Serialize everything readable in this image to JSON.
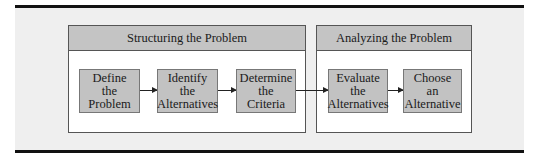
{
  "groups": [
    {
      "title": "Structuring the Problem"
    },
    {
      "title": "Analyzing the Problem"
    }
  ],
  "steps": [
    {
      "lines": [
        "Define",
        "the",
        "Problem"
      ]
    },
    {
      "lines": [
        "Identify",
        "the",
        "Alternatives"
      ]
    },
    {
      "lines": [
        "Determine",
        "the",
        "Criteria"
      ]
    },
    {
      "lines": [
        "Evaluate",
        "the",
        "Alternatives"
      ]
    },
    {
      "lines": [
        "Choose",
        "an",
        "Alternative"
      ]
    }
  ],
  "colors": {
    "panel_background": "#efefef",
    "header_fill": "#c4c4c4",
    "step_fill": "#c2c2c2",
    "rule": "#111111"
  }
}
